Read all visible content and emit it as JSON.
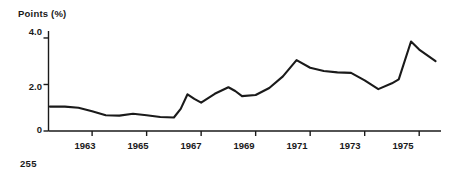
{
  "page": {
    "page_number": "255",
    "background_color": "#ffffff",
    "ink_color": "#1a1a1a"
  },
  "chart_data": {
    "type": "line",
    "title": "",
    "ylabel": "Points (%)",
    "xlabel": "",
    "ylim": [
      0,
      4.3
    ],
    "xlim": [
      1961.4,
      1975.8
    ],
    "grid": false,
    "legend": null,
    "yticks": [
      {
        "value": 0,
        "label": "0"
      },
      {
        "value": 2.0,
        "label": "2.0"
      },
      {
        "value": 4.0,
        "label": "4.0"
      }
    ],
    "xticks": [
      {
        "value": 1963,
        "label": "1963"
      },
      {
        "value": 1965,
        "label": "1965"
      },
      {
        "value": 1967,
        "label": "1967"
      },
      {
        "value": 1969,
        "label": "1969"
      },
      {
        "value": 1971,
        "label": "1971"
      },
      {
        "value": 1973,
        "label": "1973"
      },
      {
        "value": 1975,
        "label": "1975"
      }
    ],
    "series": [
      {
        "name": "Points (%)",
        "color": "#1a1a1a",
        "x": [
          1961.45,
          1962.0,
          1962.5,
          1963.0,
          1963.5,
          1964.0,
          1964.5,
          1965.0,
          1965.5,
          1966.0,
          1966.25,
          1966.5,
          1966.75,
          1967.0,
          1967.5,
          1968.0,
          1968.25,
          1968.5,
          1969.0,
          1969.5,
          1970.0,
          1970.5,
          1971.0,
          1971.5,
          1972.0,
          1972.5,
          1973.0,
          1973.5,
          1974.0,
          1974.25,
          1974.7,
          1975.0,
          1975.6
        ],
        "y": [
          1.05,
          1.05,
          1.0,
          0.85,
          0.68,
          0.66,
          0.74,
          0.68,
          0.6,
          0.58,
          0.95,
          1.58,
          1.38,
          1.22,
          1.6,
          1.88,
          1.72,
          1.5,
          1.55,
          1.85,
          2.35,
          3.05,
          2.72,
          2.58,
          2.52,
          2.5,
          2.18,
          1.8,
          2.05,
          2.22,
          3.85,
          3.5,
          3.0
        ]
      }
    ]
  }
}
